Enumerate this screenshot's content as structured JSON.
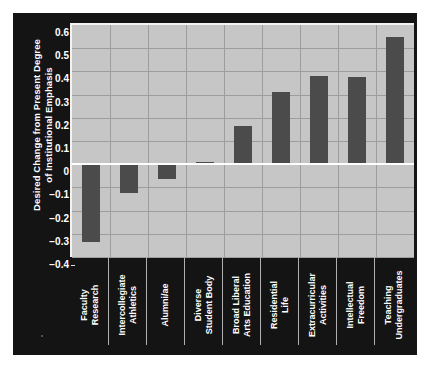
{
  "chart_data": {
    "type": "bar",
    "title": "",
    "xlabel": "",
    "ylabel": "Desired Change from Present Degree\nof Institutional Emphasis",
    "categories": [
      "Faculty\nResearch",
      "Intercollegiate\nAthletics",
      "Alumni/ae",
      "Diverse\nStudent Body",
      "Broad Liberal\nArts Education",
      "Residential\nLife",
      "Extracurricular\nActivities",
      "Intellectual\nFreedom",
      "Teaching\nUndergraduates"
    ],
    "values": [
      -0.335,
      -0.125,
      -0.065,
      0.01,
      0.165,
      0.31,
      0.38,
      0.375,
      0.55
    ],
    "ylim": [
      -0.4,
      0.6
    ],
    "yticks": [
      0.6,
      0.5,
      0.4,
      0.3,
      0.2,
      0.1,
      0,
      -0.1,
      -0.2,
      -0.3,
      -0.4
    ],
    "ytick_labels": [
      "0.6",
      "0.5",
      "0.4",
      "0.3",
      "0.2",
      "0.1",
      "0",
      "−0.1",
      "−0.2",
      "−0.3",
      "−0.4"
    ],
    "grid": true,
    "legend": null,
    "zero_line": 0,
    "colors": {
      "bar": "#4b4b4b",
      "plot_background": "#c6c6c6",
      "panel_background": "#141414",
      "gridline": "#9d9d9d",
      "zero_line": "#ffffff",
      "text": "#ffffff"
    }
  }
}
